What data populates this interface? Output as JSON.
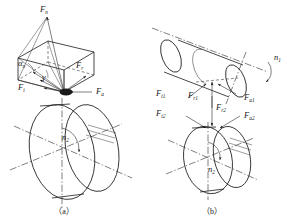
{
  "figure": {
    "subfigures": [
      {
        "caption": "（a）",
        "description": "Normal force decomposition on worm wheel",
        "labels": {
          "normal_force": "F",
          "normal_force_sub": "n",
          "radial_force": "F",
          "radial_force_sub": "r",
          "tangential_force": "F",
          "tangential_force_sub": "t",
          "axial_force": "F",
          "axial_force_sub": "a",
          "pressure_angle": "α",
          "pressure_angle_sub": "n",
          "lead_angle": "γ",
          "speed": "n",
          "speed_sub": "2"
        }
      },
      {
        "caption": "（b）",
        "description": "Force pairs on worm and worm wheel mesh",
        "labels": {
          "worm_tangential": "F",
          "worm_tangential_sub": "t1",
          "worm_radial": "F",
          "worm_radial_sub": "r1",
          "worm_axial": "F",
          "worm_axial_sub": "a1",
          "wheel_tangential": "F",
          "wheel_tangential_sub": "t2",
          "wheel_radial": "F",
          "wheel_radial_sub": "r2",
          "wheel_axial": "F",
          "wheel_axial_sub": "a2",
          "worm_speed": "n",
          "worm_speed_sub": "1",
          "wheel_speed": "n",
          "wheel_speed_sub": "2"
        }
      }
    ]
  },
  "colors": {
    "line": "#1a1a1a",
    "background": "#ffffff"
  }
}
